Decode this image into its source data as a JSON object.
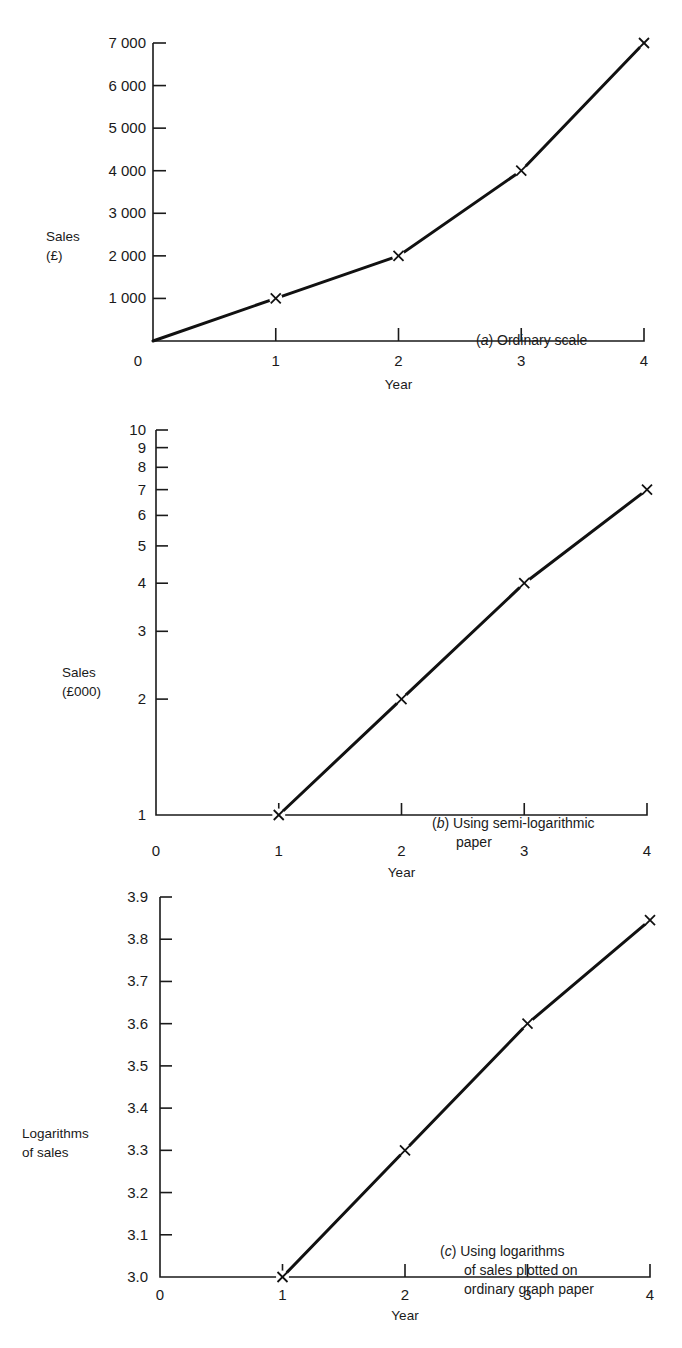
{
  "chart_data": [
    {
      "id": "a",
      "type": "line",
      "title": "(a) Ordinary scale",
      "caption_letter": "a",
      "caption_text": "Ordinary scale",
      "xlabel": "Year",
      "ylabel": [
        "Sales",
        "(£)"
      ],
      "x": [
        0,
        1,
        2,
        3,
        4
      ],
      "values": [
        0,
        1000,
        2000,
        4000,
        7000
      ],
      "markers_at": [
        1,
        2,
        3,
        4
      ],
      "xlim": [
        0,
        4
      ],
      "ylim": [
        0,
        7000
      ],
      "yscale": "linear",
      "x_ticks": [
        "0",
        "1",
        "2",
        "3",
        "4"
      ],
      "y_ticks": [
        {
          "v": 1000,
          "label": "1 000"
        },
        {
          "v": 2000,
          "label": "2 000"
        },
        {
          "v": 3000,
          "label": "3 000"
        },
        {
          "v": 4000,
          "label": "4 000"
        },
        {
          "v": 5000,
          "label": "5 000"
        },
        {
          "v": 6000,
          "label": "6 000"
        },
        {
          "v": 7000,
          "label": "7 000"
        }
      ],
      "grid": false,
      "legend": null
    },
    {
      "id": "b",
      "type": "line",
      "title": "(b) Using semi-logarithmic paper",
      "caption_letter": "b",
      "caption_text": [
        "Using semi-logarithmic",
        "paper"
      ],
      "xlabel": "Year",
      "ylabel": [
        "Sales",
        "(£000)"
      ],
      "x": [
        1,
        2,
        3,
        4
      ],
      "values": [
        1,
        2,
        4,
        7
      ],
      "markers_at": [
        1,
        2,
        3,
        4
      ],
      "xlim": [
        0,
        4
      ],
      "ylim": [
        1,
        10
      ],
      "yscale": "log",
      "x_ticks": [
        "0",
        "1",
        "2",
        "3",
        "4"
      ],
      "y_ticks": [
        {
          "v": 1,
          "label": "1"
        },
        {
          "v": 2,
          "label": "2"
        },
        {
          "v": 3,
          "label": "3"
        },
        {
          "v": 4,
          "label": "4"
        },
        {
          "v": 5,
          "label": "5"
        },
        {
          "v": 6,
          "label": "6"
        },
        {
          "v": 7,
          "label": "7"
        },
        {
          "v": 8,
          "label": "8"
        },
        {
          "v": 9,
          "label": "9"
        },
        {
          "v": 10,
          "label": "10"
        }
      ],
      "grid": false,
      "legend": null
    },
    {
      "id": "c",
      "type": "line",
      "title": "(c) Using logarithms of sales plotted on ordinary graph paper",
      "caption_letter": "c",
      "caption_text": [
        "Using logarithms",
        "of sales plotted on",
        "ordinary graph paper"
      ],
      "xlabel": "Year",
      "ylabel": [
        "Logarithms",
        "of sales"
      ],
      "x": [
        1,
        2,
        3,
        4
      ],
      "values": [
        3.0,
        3.3,
        3.6,
        3.845
      ],
      "markers_at": [
        1,
        2,
        3,
        4
      ],
      "xlim": [
        0,
        4
      ],
      "ylim": [
        3.0,
        3.9
      ],
      "yscale": "linear",
      "x_ticks": [
        "0",
        "1",
        "2",
        "3",
        "4"
      ],
      "y_ticks": [
        {
          "v": 3.0,
          "label": "3.0"
        },
        {
          "v": 3.1,
          "label": "3.1"
        },
        {
          "v": 3.2,
          "label": "3.2"
        },
        {
          "v": 3.3,
          "label": "3.3"
        },
        {
          "v": 3.4,
          "label": "3.4"
        },
        {
          "v": 3.5,
          "label": "3.5"
        },
        {
          "v": 3.6,
          "label": "3.6"
        },
        {
          "v": 3.7,
          "label": "3.7"
        },
        {
          "v": 3.8,
          "label": "3.8"
        },
        {
          "v": 3.9,
          "label": "3.9"
        }
      ],
      "grid": false,
      "legend": null
    }
  ]
}
